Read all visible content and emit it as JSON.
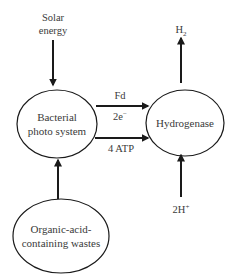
{
  "diagram": {
    "nodes": {
      "bacterial": {
        "line1": "Bacterial",
        "line2": "photo system"
      },
      "hydrogenase": {
        "label": "Hydrogenase"
      },
      "organic": {
        "line1": "Organic-acid-",
        "line2": "containing wastes"
      }
    },
    "inputs": {
      "solar": {
        "line1": "Solar",
        "line2": "energy"
      },
      "protons": {
        "main": "2H",
        "sup": "+"
      }
    },
    "outputs": {
      "hydrogen": {
        "main": "H",
        "sub": "2"
      }
    },
    "edges": {
      "upper": {
        "label_above": "Fd",
        "label_below_main": "2e",
        "label_below_sup": "−"
      },
      "lower": {
        "label_below": "4 ATP"
      }
    },
    "colors": {
      "stroke": "#1a1a1a",
      "text": "#3a3a3a",
      "background": "#ffffff"
    }
  }
}
